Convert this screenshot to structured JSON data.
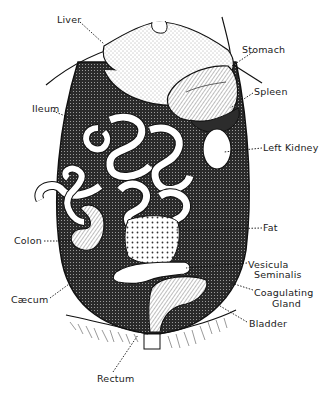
{
  "diagram": {
    "colors": {
      "ink": "#1a1a1a",
      "paper": "#ffffff",
      "shade": "#3a3a3a",
      "stipple": "#efefef"
    },
    "labels": {
      "liver": "Liver",
      "stomach": "Stomach",
      "ileum": "Ileum",
      "spleen": "Spleen",
      "left_kidney": "Left Kidney",
      "fat": "Fat",
      "colon": "Colon",
      "vesicula_seminalis_1": "Vesicula",
      "vesicula_seminalis_2": "Seminalis",
      "coagulating_gland_1": "Coagulating",
      "coagulating_gland_2": "Gland",
      "caecum": "Cæcum",
      "bladder": "Bladder",
      "rectum": "Rectum"
    }
  }
}
